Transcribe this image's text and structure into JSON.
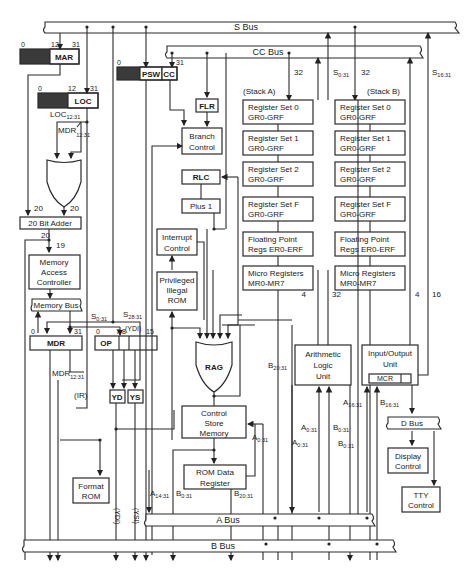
{
  "diagram": {
    "buses": {
      "s_bus": "S Bus",
      "cc_bus": "CC Bus",
      "memory_bus": "Memory Bus",
      "a_bus": "A Bus",
      "b_bus": "B Bus",
      "d_bus": "D Bus"
    },
    "registers": {
      "mar": {
        "label": "MAR",
        "bit_start": "0",
        "bit_mid": "12",
        "bit_end": "31"
      },
      "loc": {
        "label": "LOC",
        "bit_start": "0",
        "bit_mid": "12",
        "bit_end": "31",
        "sub": "LOC",
        "sub_range": "12:31"
      },
      "psw": {
        "label": "PSW",
        "cc": "CC",
        "bit_start": "0",
        "bit_end": "31"
      },
      "mdr": {
        "label": "MDR",
        "bit_start": "0",
        "bit_end": "31"
      },
      "ir": {
        "op": "OP",
        "bits": [
          "0",
          "7",
          "8",
          "15"
        ],
        "label": "(IR)",
        "ydi": "(YDI)"
      }
    },
    "blocks": {
      "adder": "20 Bit Adder",
      "mac": [
        "Memory",
        "Access",
        "Controller"
      ],
      "flr": "FLR",
      "branch": [
        "Branch",
        "Control"
      ],
      "rlc": "RLC",
      "plus1": "Plus 1",
      "interrupt": [
        "Interrupt",
        "Control"
      ],
      "priv_rom": [
        "Privileged",
        "Illegal",
        "ROM"
      ],
      "rag": "RAG",
      "csm": [
        "Control",
        "Store",
        "Memory"
      ],
      "rom_data": [
        "ROM Data",
        "Register"
      ],
      "format_rom": [
        "Format",
        "ROM"
      ],
      "yd": "YD",
      "ys": "YS",
      "alu": [
        "Arithmetic",
        "Logic",
        "Unit"
      ],
      "iou": [
        "Input/Output",
        "Unit"
      ],
      "mcr": "MCR",
      "display": [
        "Display",
        "Control"
      ],
      "tty": [
        "TTY",
        "Control"
      ]
    },
    "stacks": {
      "a_label": "(Stack A)",
      "b_label": "(Stack B)",
      "a": [
        {
          "name": "Register Set 0",
          "range": "GR0-GRF"
        },
        {
          "name": "Register Set 1",
          "range": "GR0-GRF"
        },
        {
          "name": "Register Set 2",
          "range": "GR0-GRF"
        },
        {
          "name": "Register Set F",
          "range": "GR0-GRF"
        },
        {
          "name": "Floating Point",
          "range": "Regs ER0-ERF"
        },
        {
          "name": "Micro Registers",
          "range": "MR0-MR7"
        }
      ],
      "b": [
        {
          "name": "Register Set 0",
          "range": "GR0-GRF"
        },
        {
          "name": "Register Set 1",
          "range": "GR0-GRF"
        },
        {
          "name": "Register Set 2",
          "range": "GR0-GRF"
        },
        {
          "name": "Register Set F",
          "range": "GR0-GRF"
        },
        {
          "name": "Floating Point",
          "range": "Regs ER0-ERF"
        },
        {
          "name": "Micro Registers",
          "range": "MR0-MR7"
        }
      ]
    },
    "signals": {
      "w20a": "20",
      "w20b": "20",
      "w20c": "20",
      "w19": "19",
      "w32a": "32",
      "w32b": "32",
      "s031": "S",
      "s031_sub": "0:31",
      "s1631": "S",
      "s1631_sub": "16:31",
      "ir_s031": "S",
      "ir_s031_sub": "0:31",
      "s2831": "S",
      "s2831_sub": "28:31",
      "mdr_in": "MDR",
      "mdr_in_sub": "12:31",
      "mdr_out": "MDR",
      "mdr_out_sub": "12:31",
      "alu_w4": "4",
      "alu_w32": "32",
      "iou_w4": "4",
      "iou_w16": "16",
      "b2031_mid": "B",
      "b2031_mid_sub": "20:31",
      "a031_1": "A",
      "a031_1_sub": "0:31",
      "a031_2": "A",
      "a031_2_sub": "0:31",
      "a031_3": "A",
      "a031_3_sub": "0:31",
      "b031_1": "B",
      "b031_1_sub": "0:31",
      "b031_2": "B",
      "b031_2_sub": "0:31",
      "a1631": "A",
      "a1631_sub": "16:31",
      "b1631": "B",
      "b1631_sub": "16:31",
      "a1431": "A",
      "a1431_sub": "14:31",
      "b031_rom": "B",
      "b031_rom_sub": "0:31",
      "b2031_rom": "B",
      "b2031_rom_sub": "20:31",
      "ydi_v": "(YDI)",
      "ysi_v": "(YSI)"
    }
  }
}
